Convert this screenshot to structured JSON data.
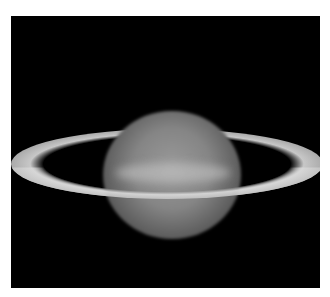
{
  "caption_cutoff": "",
  "image": {
    "subject": "Saturn with rings, telescopic photograph",
    "background": "#000000"
  }
}
